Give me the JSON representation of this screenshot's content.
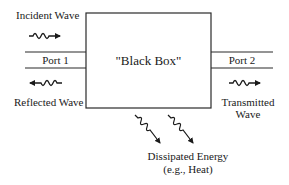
{
  "diagram": {
    "box_label": "\"Black Box\"",
    "ports": [
      {
        "label": "Port 1"
      },
      {
        "label": "Port 2"
      }
    ],
    "waves": {
      "incident": "Incident Wave",
      "reflected": "Reflected Wave",
      "transmitted_line1": "Transmitted",
      "transmitted_line2": "Wave"
    },
    "dissipated": {
      "line1": "Dissipated Energy",
      "line2": "(e.g., Heat)"
    },
    "icons": {
      "incident": "wavy-arrow-right-icon",
      "reflected": "wavy-arrow-left-icon",
      "transmitted": "wavy-arrow-right-icon",
      "dissipated": "wavy-arrow-down-right-icon"
    },
    "colors": {
      "line": "#2a2a2a",
      "text": "#1a1a1a",
      "background": "#ffffff"
    }
  }
}
